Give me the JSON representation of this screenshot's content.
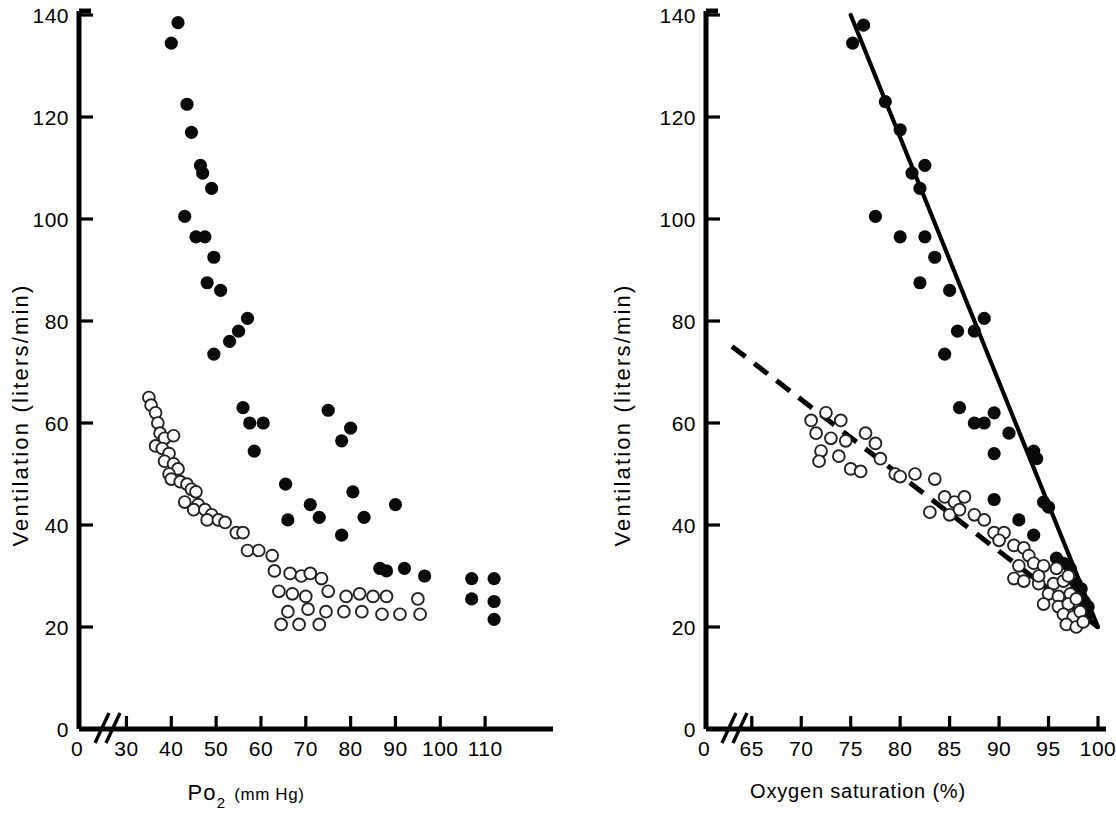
{
  "figure": {
    "title": "",
    "panels": [
      "left",
      "right"
    ]
  },
  "chart_data": [
    {
      "type": "scatter",
      "panel": "left",
      "title": "",
      "xlabel": "Po2 (mm Hg)",
      "xlabel_main": "Po",
      "xlabel_sub": "2",
      "xlabel_unit": "(mm Hg)",
      "ylabel": "Ventilation (liters/min)",
      "xlim": [
        27,
        118
      ],
      "ylim": [
        0,
        140
      ],
      "xticks": [
        30,
        40,
        50,
        60,
        70,
        80,
        90,
        100,
        110
      ],
      "xtick_labels": [
        "30",
        "40",
        "50",
        "60",
        "70",
        "80",
        "90",
        "100",
        "110"
      ],
      "yticks": [
        0,
        20,
        40,
        60,
        80,
        100,
        120,
        140
      ],
      "ytick_labels": [
        "0",
        "20",
        "40",
        "60",
        "80",
        "100",
        "120",
        "140"
      ],
      "axis_break": true,
      "origin_label": "0",
      "grid": false,
      "legend": null,
      "series": [
        {
          "name": "hypercapnia",
          "marker": "filled-circle",
          "color": "#0a0a0a",
          "points": [
            [
              41.5,
              138.5
            ],
            [
              40.0,
              134.5
            ],
            [
              43.5,
              122.5
            ],
            [
              44.5,
              117.0
            ],
            [
              46.5,
              110.5
            ],
            [
              47.0,
              109.0
            ],
            [
              49.0,
              106.0
            ],
            [
              43.0,
              100.5
            ],
            [
              45.5,
              96.5
            ],
            [
              47.5,
              96.5
            ],
            [
              49.5,
              92.5
            ],
            [
              48.0,
              87.5
            ],
            [
              51.0,
              86.0
            ],
            [
              57.0,
              80.5
            ],
            [
              55.0,
              78.0
            ],
            [
              53.0,
              76.0
            ],
            [
              49.5,
              73.5
            ],
            [
              56.0,
              63.0
            ],
            [
              57.5,
              60.0
            ],
            [
              60.5,
              60.0
            ],
            [
              75.0,
              62.5
            ],
            [
              80.0,
              59.0
            ],
            [
              78.0,
              56.5
            ],
            [
              58.5,
              54.5
            ],
            [
              65.5,
              48.0
            ],
            [
              80.5,
              46.5
            ],
            [
              71.0,
              44.0
            ],
            [
              90.0,
              44.0
            ],
            [
              66.0,
              41.0
            ],
            [
              73.0,
              41.5
            ],
            [
              83.0,
              41.5
            ],
            [
              78.0,
              38.0
            ],
            [
              86.5,
              31.5
            ],
            [
              88.0,
              31.0
            ],
            [
              92.0,
              31.5
            ],
            [
              96.5,
              30.0
            ],
            [
              107.0,
              29.5
            ],
            [
              112.0,
              29.5
            ],
            [
              107.0,
              25.5
            ],
            [
              112.0,
              25.0
            ],
            [
              112.0,
              21.5
            ]
          ]
        },
        {
          "name": "hypoxia",
          "marker": "open-circle",
          "color": "#ffffff",
          "points": [
            [
              35.0,
              65.0
            ],
            [
              35.5,
              63.5
            ],
            [
              36.5,
              62.0
            ],
            [
              37.0,
              60.0
            ],
            [
              37.5,
              58.0
            ],
            [
              38.5,
              57.0
            ],
            [
              40.5,
              57.5
            ],
            [
              36.5,
              55.5
            ],
            [
              38.0,
              55.0
            ],
            [
              39.5,
              54.0
            ],
            [
              38.5,
              52.5
            ],
            [
              40.5,
              52.0
            ],
            [
              41.5,
              51.0
            ],
            [
              39.5,
              50.0
            ],
            [
              40.0,
              49.0
            ],
            [
              42.0,
              48.5
            ],
            [
              43.5,
              48.0
            ],
            [
              44.5,
              47.0
            ],
            [
              45.5,
              46.5
            ],
            [
              43.0,
              44.5
            ],
            [
              46.0,
              44.0
            ],
            [
              45.0,
              43.0
            ],
            [
              47.5,
              43.0
            ],
            [
              49.0,
              42.0
            ],
            [
              48.0,
              41.0
            ],
            [
              50.5,
              41.0
            ],
            [
              52.0,
              40.5
            ],
            [
              54.5,
              38.5
            ],
            [
              56.0,
              38.5
            ],
            [
              57.0,
              35.0
            ],
            [
              59.5,
              35.0
            ],
            [
              62.5,
              34.0
            ],
            [
              63.0,
              31.0
            ],
            [
              66.5,
              30.5
            ],
            [
              69.0,
              30.0
            ],
            [
              71.0,
              30.5
            ],
            [
              73.5,
              29.5
            ],
            [
              64.0,
              27.0
            ],
            [
              67.0,
              26.5
            ],
            [
              70.0,
              26.0
            ],
            [
              75.0,
              27.0
            ],
            [
              79.0,
              26.0
            ],
            [
              82.0,
              26.5
            ],
            [
              85.0,
              26.0
            ],
            [
              88.0,
              26.0
            ],
            [
              95.0,
              25.5
            ],
            [
              66.0,
              23.0
            ],
            [
              70.5,
              23.5
            ],
            [
              74.5,
              23.0
            ],
            [
              78.5,
              23.0
            ],
            [
              82.5,
              23.0
            ],
            [
              87.0,
              22.5
            ],
            [
              91.0,
              22.5
            ],
            [
              95.5,
              22.5
            ],
            [
              64.5,
              20.5
            ],
            [
              68.5,
              20.5
            ],
            [
              73.0,
              20.5
            ]
          ]
        }
      ]
    },
    {
      "type": "scatter",
      "panel": "right",
      "title": "",
      "xlabel": "Oxygen saturation (%)",
      "ylabel": "Ventilation (liters/min)",
      "xlim": [
        63,
        100
      ],
      "ylim": [
        0,
        140
      ],
      "xticks": [
        65,
        70,
        75,
        80,
        85,
        90,
        95,
        100
      ],
      "xtick_labels": [
        "65",
        "70",
        "75",
        "80",
        "85",
        "90",
        "95",
        "100"
      ],
      "yticks": [
        0,
        20,
        40,
        60,
        80,
        100,
        120,
        140
      ],
      "ytick_labels": [
        "0",
        "20",
        "40",
        "60",
        "80",
        "100",
        "120",
        "140"
      ],
      "axis_break": true,
      "origin_label": "0",
      "grid": false,
      "legend": null,
      "series": [
        {
          "name": "hypercapnia",
          "marker": "filled-circle",
          "color": "#0a0a0a",
          "points": [
            [
              76.3,
              138.0
            ],
            [
              75.2,
              134.5
            ],
            [
              78.5,
              123.0
            ],
            [
              80.0,
              117.5
            ],
            [
              82.5,
              110.5
            ],
            [
              81.2,
              109.0
            ],
            [
              82.0,
              106.0
            ],
            [
              77.5,
              100.5
            ],
            [
              80.0,
              96.5
            ],
            [
              82.5,
              96.5
            ],
            [
              83.5,
              92.5
            ],
            [
              82.0,
              87.5
            ],
            [
              85.0,
              86.0
            ],
            [
              88.5,
              80.5
            ],
            [
              87.5,
              78.0
            ],
            [
              85.8,
              78.0
            ],
            [
              84.5,
              73.5
            ],
            [
              86.0,
              63.0
            ],
            [
              89.5,
              62.0
            ],
            [
              87.5,
              60.0
            ],
            [
              88.5,
              60.0
            ],
            [
              91.0,
              58.0
            ],
            [
              89.5,
              54.0
            ],
            [
              93.5,
              54.5
            ],
            [
              93.8,
              53.0
            ],
            [
              89.5,
              45.0
            ],
            [
              94.5,
              44.5
            ],
            [
              95.0,
              43.5
            ],
            [
              92.0,
              41.0
            ],
            [
              89.8,
              38.0
            ],
            [
              93.5,
              38.0
            ],
            [
              95.8,
              33.5
            ],
            [
              96.5,
              32.5
            ],
            [
              97.2,
              31.5
            ],
            [
              97.0,
              29.5
            ],
            [
              97.8,
              28.5
            ],
            [
              98.3,
              27.5
            ],
            [
              98.0,
              26.0
            ],
            [
              98.6,
              25.0
            ],
            [
              99.0,
              24.0
            ],
            [
              98.8,
              22.0
            ]
          ]
        },
        {
          "name": "hypoxia",
          "marker": "open-circle",
          "color": "#ffffff",
          "points": [
            [
              71.0,
              60.5
            ],
            [
              72.5,
              62.0
            ],
            [
              74.0,
              60.5
            ],
            [
              71.5,
              58.0
            ],
            [
              73.0,
              57.0
            ],
            [
              74.5,
              56.5
            ],
            [
              76.5,
              58.0
            ],
            [
              77.5,
              56.0
            ],
            [
              72.0,
              54.5
            ],
            [
              73.8,
              53.5
            ],
            [
              71.8,
              52.5
            ],
            [
              78.0,
              53.0
            ],
            [
              75.0,
              51.0
            ],
            [
              76.0,
              50.5
            ],
            [
              79.5,
              50.0
            ],
            [
              80.0,
              49.5
            ],
            [
              81.5,
              50.0
            ],
            [
              83.5,
              49.0
            ],
            [
              84.5,
              45.5
            ],
            [
              85.5,
              44.5
            ],
            [
              86.5,
              45.5
            ],
            [
              83.0,
              42.5
            ],
            [
              85.0,
              42.0
            ],
            [
              86.0,
              43.0
            ],
            [
              87.5,
              42.0
            ],
            [
              88.5,
              41.0
            ],
            [
              89.5,
              38.5
            ],
            [
              90.5,
              38.5
            ],
            [
              90.0,
              37.0
            ],
            [
              91.5,
              36.0
            ],
            [
              92.5,
              35.5
            ],
            [
              93.0,
              34.0
            ],
            [
              92.0,
              32.0
            ],
            [
              93.5,
              32.5
            ],
            [
              94.5,
              32.0
            ],
            [
              91.5,
              29.5
            ],
            [
              92.5,
              29.0
            ],
            [
              94.0,
              28.5
            ],
            [
              95.5,
              28.5
            ],
            [
              96.5,
              29.0
            ],
            [
              97.0,
              30.0
            ],
            [
              95.0,
              26.5
            ],
            [
              96.0,
              26.0
            ],
            [
              97.2,
              26.5
            ],
            [
              94.5,
              24.5
            ],
            [
              96.0,
              24.0
            ],
            [
              97.0,
              24.5
            ],
            [
              97.8,
              25.5
            ],
            [
              96.5,
              22.5
            ],
            [
              97.5,
              22.0
            ],
            [
              98.2,
              23.0
            ],
            [
              96.8,
              20.5
            ],
            [
              97.8,
              20.0
            ],
            [
              98.5,
              21.0
            ],
            [
              95.8,
              31.5
            ],
            [
              94.0,
              30.0
            ]
          ]
        }
      ],
      "fit_lines": [
        {
          "name": "hypercapnia-regression",
          "style": "solid",
          "x0": 75.0,
          "y0": 140.0,
          "x1": 100.0,
          "y1": 20.0
        },
        {
          "name": "hypoxia-regression",
          "style": "dashed",
          "x0": 63.0,
          "y0": 75.0,
          "x1": 100.0,
          "y1": 20.0
        }
      ]
    }
  ]
}
